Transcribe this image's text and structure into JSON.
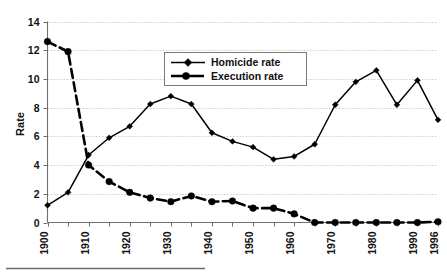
{
  "chart_data": {
    "type": "line",
    "title": "",
    "xlabel": "",
    "ylabel": "Rate",
    "ylim": [
      0,
      14
    ],
    "ytick_labels": [
      "0",
      "2",
      "4",
      "6",
      "8",
      "10",
      "12",
      "14"
    ],
    "ytick_values": [
      0,
      2,
      4,
      6,
      8,
      10,
      12,
      14
    ],
    "grid": true,
    "legend_position": "top-center",
    "x": [
      1900,
      1905,
      1910,
      1915,
      1920,
      1925,
      1930,
      1935,
      1940,
      1945,
      1950,
      1955,
      1960,
      1965,
      1970,
      1975,
      1980,
      1985,
      1990,
      1996
    ],
    "xtick_labels": [
      "1900",
      "1910",
      "1920",
      "1930",
      "1940",
      "1950",
      "1960",
      "1970",
      "1980",
      "1990",
      "1996"
    ],
    "xtick_label_values": [
      1900,
      1910,
      1920,
      1930,
      1940,
      1950,
      1960,
      1970,
      1980,
      1990,
      1996
    ],
    "series": [
      {
        "name": "Homicide rate",
        "marker": "diamond",
        "style": "solid",
        "values": [
          1.2,
          2.1,
          4.7,
          5.9,
          6.7,
          8.25,
          8.8,
          8.25,
          6.25,
          5.65,
          5.25,
          4.4,
          4.6,
          5.45,
          8.2,
          9.8,
          10.6,
          8.2,
          9.9,
          7.15
        ]
      },
      {
        "name": "Execution rate",
        "marker": "circle",
        "style": "dash-dot",
        "values": [
          12.6,
          11.9,
          4.0,
          2.85,
          2.1,
          1.7,
          1.45,
          1.85,
          1.45,
          1.5,
          1.0,
          1.0,
          0.6,
          0.0,
          0.0,
          0.0,
          0.0,
          0.0,
          0.0,
          0.05
        ]
      }
    ]
  },
  "legend": {
    "items": [
      {
        "label": "Homicide rate"
      },
      {
        "label": "Execution rate"
      }
    ]
  },
  "axes": {
    "y_axis_title": "Rate"
  }
}
